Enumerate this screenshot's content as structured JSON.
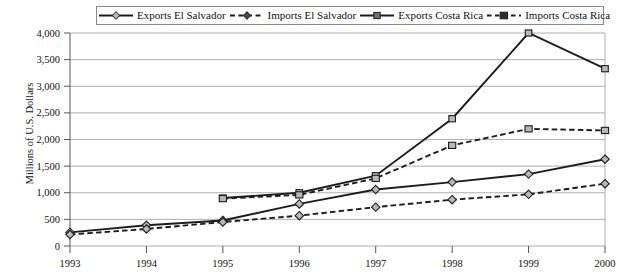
{
  "chart_data": {
    "type": "line",
    "title": "",
    "xlabel": "",
    "ylabel": "Millions of U.S. Dollars",
    "x": [
      1993,
      1994,
      1995,
      1996,
      1997,
      1998,
      1999,
      2000
    ],
    "xtick_labels": [
      "1993",
      "1994",
      "1995",
      "1996",
      "1997",
      "1998",
      "1999",
      "2000"
    ],
    "ylim": [
      0,
      4000
    ],
    "ytick_values": [
      0,
      500,
      1000,
      1500,
      2000,
      2500,
      3000,
      3500,
      4000
    ],
    "ytick_labels": [
      "0",
      "500",
      "1,000",
      "1,500",
      "2,000",
      "2,500",
      "3,000",
      "3,500",
      "4,000"
    ],
    "grid": true,
    "legend_position": "top",
    "series": [
      {
        "name": "Exports El Salvador",
        "marker": "diamond",
        "line_style": "solid",
        "x": [
          1993,
          1994,
          1995,
          1996,
          1997,
          1998,
          1999,
          2000
        ],
        "values": [
          255,
          390,
          480,
          790,
          1060,
          1200,
          1350,
          1630
        ]
      },
      {
        "name": "Imports El Salvador",
        "marker": "diamond",
        "line_style": "dashed",
        "x": [
          1993,
          1994,
          1995,
          1996,
          1997,
          1998,
          1999,
          2000
        ],
        "values": [
          215,
          320,
          450,
          570,
          730,
          870,
          970,
          1170
        ]
      },
      {
        "name": "Exports Costa Rica",
        "marker": "square",
        "line_style": "solid",
        "x": [
          1995,
          1996,
          1997,
          1998,
          1999,
          2000
        ],
        "values": [
          900,
          1000,
          1320,
          2390,
          4000,
          3330
        ]
      },
      {
        "name": "Imports Costa Rica",
        "marker": "square",
        "line_style": "dashed",
        "x": [
          1995,
          1996,
          1997,
          1998,
          1999,
          2000
        ],
        "values": [
          890,
          960,
          1270,
          1890,
          2200,
          2170
        ]
      }
    ]
  },
  "legend": {
    "entries": [
      {
        "label": "Exports El Salvador"
      },
      {
        "label": "Imports El Salvador"
      },
      {
        "label": "Exports Costa Rica"
      },
      {
        "label": "Imports Costa Rica"
      }
    ]
  }
}
